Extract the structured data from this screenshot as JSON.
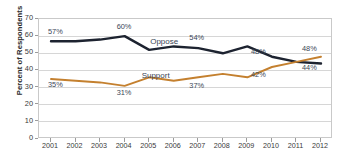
{
  "chart_data": {
    "type": "line",
    "title": "",
    "xlabel": "",
    "ylabel": "Percent of Respondents",
    "ylim": [
      0,
      70
    ],
    "ytick_values": [
      0,
      10,
      20,
      30,
      40,
      50,
      60,
      70
    ],
    "ytick_labels": [
      "0",
      "10",
      "20",
      "30",
      "40",
      "50",
      "60",
      "70"
    ],
    "grid": true,
    "legend": "inline-series-labels",
    "x": [
      2001,
      2002,
      2003,
      2004,
      2005,
      2006,
      2007,
      2008,
      2009,
      2010,
      2011,
      2012
    ],
    "categories": [
      "2001",
      "2002",
      "2003",
      "2004",
      "2005",
      "2006",
      "2007",
      "2008",
      "2009",
      "2010",
      "2011",
      "2012"
    ],
    "series": [
      {
        "name": "Oppose",
        "color": "#1d2330",
        "values": [
          57,
          57,
          58,
          60,
          52,
          54,
          53,
          50,
          54,
          48,
          45,
          44
        ]
      },
      {
        "name": "Support",
        "color": "#c4802f",
        "values": [
          35,
          34,
          33,
          31,
          36,
          34,
          36,
          38,
          36,
          42,
          45,
          48
        ]
      }
    ],
    "annotations": [
      {
        "text": "57%",
        "series": "Oppose",
        "x": 2001
      },
      {
        "text": "60%",
        "series": "Oppose",
        "x": 2004
      },
      {
        "text": "Oppose",
        "series": "Oppose",
        "x": 2005
      },
      {
        "text": "54%",
        "series": "Oppose",
        "x": 2007
      },
      {
        "text": "48%",
        "series": "Oppose",
        "x": 2010
      },
      {
        "text": "44%",
        "series": "Oppose",
        "x": 2012
      },
      {
        "text": "35%",
        "series": "Support",
        "x": 2001
      },
      {
        "text": "Support",
        "series": "Support",
        "x": 2004
      },
      {
        "text": "31%",
        "series": "Support",
        "x": 2004
      },
      {
        "text": "37%",
        "series": "Support",
        "x": 2007
      },
      {
        "text": "42%",
        "series": "Support",
        "x": 2010
      },
      {
        "text": "48%",
        "series": "Support",
        "x": 2012
      }
    ]
  },
  "axis": {
    "y_title": "Percent of Respondents",
    "y_ticks": [
      "70",
      "60",
      "50",
      "40",
      "30",
      "20",
      "10",
      "0"
    ],
    "x_ticks": [
      "2001",
      "2002",
      "2003",
      "2004",
      "2005",
      "2006",
      "2007",
      "2008",
      "2009",
      "2010",
      "2011",
      "2012"
    ]
  },
  "labels": {
    "oppose_series": "Oppose",
    "support_series": "Support",
    "oppose_2001": "57%",
    "oppose_2004": "60%",
    "oppose_2007": "54%",
    "oppose_2010": "48%",
    "oppose_2012": "44%",
    "support_2001": "35%",
    "support_2004": "31%",
    "support_2007": "37%",
    "support_2010": "42%",
    "support_2012": "48%"
  },
  "title_fragment": ""
}
